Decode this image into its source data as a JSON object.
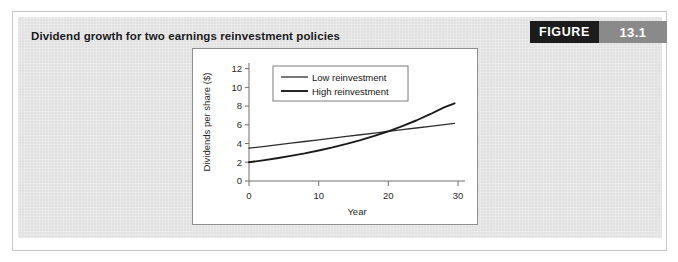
{
  "figure": {
    "title": "Dividend growth for two earnings reinvestment policies",
    "badge_word": "FIGURE",
    "badge_number": "13.1",
    "badge_word_bg": "#1c1c1c",
    "badge_number_bg": "#8a8a8a",
    "panel_bg": "#e4e4e4"
  },
  "chart_data": {
    "type": "line",
    "title": "",
    "xlabel": "Year",
    "ylabel": "Dividends per share ($)",
    "xlim": [
      0,
      31
    ],
    "ylim": [
      0,
      12.6
    ],
    "xticks": [
      0,
      10,
      20,
      30
    ],
    "yticks": [
      0,
      2,
      4,
      6,
      8,
      10,
      12
    ],
    "xtick_labels": [
      "0",
      "10",
      "20",
      "30"
    ],
    "ytick_labels": [
      "0",
      "2",
      "4",
      "6",
      "8",
      "10",
      "12"
    ],
    "grid": false,
    "legend_position": "upper left",
    "x": [
      0,
      2,
      4,
      6,
      8,
      10,
      12,
      14,
      16,
      18,
      20,
      22,
      24,
      26,
      28,
      29.5
    ],
    "series": [
      {
        "name": "Low reinvestment",
        "color": "#2e2e2e",
        "line_width": 1.3,
        "values": [
          3.5,
          3.68,
          3.86,
          4.04,
          4.22,
          4.4,
          4.58,
          4.76,
          4.94,
          5.12,
          5.3,
          5.48,
          5.66,
          5.84,
          6.02,
          6.16
        ]
      },
      {
        "name": "High reinvestment",
        "color": "#1a1a1a",
        "line_width": 1.9,
        "values": [
          2.0,
          2.2,
          2.43,
          2.68,
          2.95,
          3.26,
          3.59,
          3.96,
          4.37,
          4.82,
          5.31,
          5.86,
          6.46,
          7.13,
          7.86,
          8.3
        ]
      }
    ],
    "series_high_endpoint": 10.9,
    "crossover_year": 13.6,
    "crossover_value": 4.72
  },
  "legend": {
    "entries": [
      {
        "label": "Low reinvestment",
        "swatch_width": 1.3
      },
      {
        "label": "High reinvestment",
        "swatch_width": 2.0
      }
    ]
  }
}
